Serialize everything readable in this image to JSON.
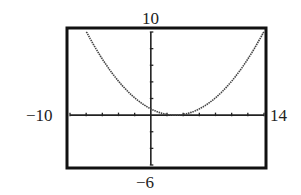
{
  "chart_data": {
    "type": "line",
    "title": "",
    "xlabel": "",
    "ylabel": "",
    "xlim": [
      -10,
      14
    ],
    "ylim": [
      -6,
      10
    ],
    "xscale": 2,
    "yscale": 2,
    "grid": false,
    "legend": null,
    "window_labels": {
      "xmin": "−10",
      "xmax": "14",
      "ymin": "−6",
      "ymax": "10"
    },
    "series": [
      {
        "name": "y = (x−3)^2/12",
        "x": [
          -8,
          -6,
          -4,
          -2,
          0,
          2,
          3,
          4,
          6,
          8,
          10,
          12,
          14
        ],
        "y": [
          10.08,
          6.75,
          4.08,
          2.08,
          0.75,
          0.08,
          0,
          0.08,
          0.75,
          2.08,
          4.08,
          6.75,
          10.08
        ]
      }
    ]
  },
  "colors": {
    "frame": "#111111",
    "curve": "#444444",
    "axis": "#222222",
    "background": "#ffffff"
  }
}
